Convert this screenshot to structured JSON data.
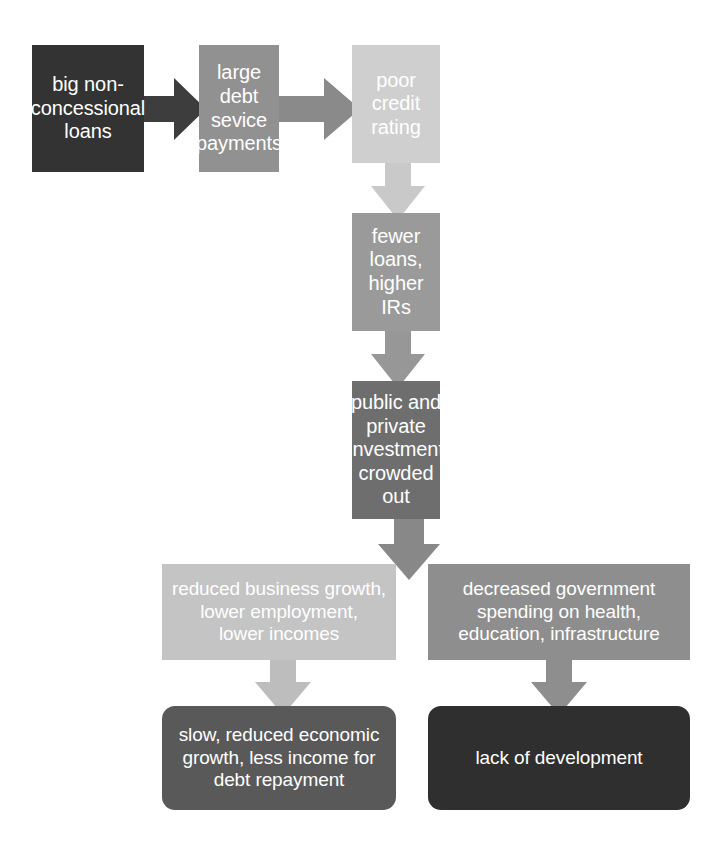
{
  "diagram": {
    "background_color": "#ffffff",
    "nodes": [
      {
        "id": "big-loans",
        "label": "big non-\nconcessional\nloans",
        "color": "#333333",
        "text_color": "#ffffff",
        "shape": "rectangle"
      },
      {
        "id": "debt-service",
        "label": "large debt\nsevice\npayments",
        "color": "#919191",
        "text_color": "#ffffff",
        "shape": "rectangle"
      },
      {
        "id": "credit-rating",
        "label": "poor\ncredit\nrating",
        "color": "#cfcfcf",
        "text_color": "#ffffff",
        "shape": "rectangle"
      },
      {
        "id": "fewer-loans",
        "label": "fewer\nloans,\nhigher IRs",
        "color": "#9a9a9a",
        "text_color": "#ffffff",
        "shape": "rectangle"
      },
      {
        "id": "crowded-out",
        "label": "public and\nprivate\ninvestment\ncrowded\nout",
        "color": "#6e6e6e",
        "text_color": "#ffffff",
        "shape": "rectangle"
      },
      {
        "id": "reduced-business",
        "label": "reduced business growth,\nlower employment,\nlower incomes",
        "color": "#c4c4c4",
        "text_color": "#ffffff",
        "shape": "rectangle"
      },
      {
        "id": "decreased-gov",
        "label": "decreased government\nspending on health,\neducation, infrastructure",
        "color": "#8e8e8e",
        "text_color": "#ffffff",
        "shape": "rectangle"
      },
      {
        "id": "slow-growth",
        "label": "slow, reduced economic\ngrowth, less income for\ndebt repayment",
        "color": "#595959",
        "text_color": "#ffffff",
        "shape": "rounded-rectangle"
      },
      {
        "id": "lack-dev",
        "label": "lack of development",
        "color": "#2f2f2f",
        "text_color": "#ffffff",
        "shape": "rounded-rectangle"
      }
    ],
    "arrows": [
      {
        "id": "big-loans-to-debt-service",
        "direction": "right",
        "color": "#3d3d3d"
      },
      {
        "id": "debt-service-to-credit-rating",
        "direction": "right",
        "color": "#8a8a8a"
      },
      {
        "id": "credit-rating-to-fewer-loans",
        "direction": "down",
        "color": "#c9c9c9"
      },
      {
        "id": "fewer-loans-to-crowded-out",
        "direction": "down",
        "color": "#979797"
      },
      {
        "id": "crowded-out-to-row",
        "direction": "down",
        "color": "#888888"
      },
      {
        "id": "reduced-business-to-slow-growth",
        "direction": "down",
        "color": "#bdbdbd"
      },
      {
        "id": "decreased-gov-to-lack-dev",
        "direction": "down",
        "color": "#8e8e8e"
      }
    ]
  }
}
